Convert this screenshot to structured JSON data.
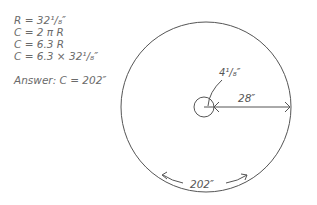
{
  "equations": [
    "R = 32¹/₈″",
    "C = 2 π R",
    "C = 6.3 R",
    "C = 6.3 × 32¹/₈″"
  ],
  "answer": "Answer: C = 202″",
  "diagram": {
    "inner_radius_label": "4¹/₈″",
    "radius_label": "28″",
    "circumference_label": "202″"
  }
}
